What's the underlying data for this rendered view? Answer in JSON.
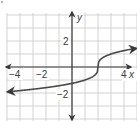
{
  "chart_data": {
    "type": "line",
    "title": "",
    "function": "y = cbrt(x - 2)",
    "xlabel": "x",
    "ylabel": "y",
    "xlim": [
      -5,
      5
    ],
    "ylim": [
      -4,
      4
    ],
    "grid": true,
    "grid_step": 1,
    "x_tick_labels": [
      {
        "value": -4,
        "label": "−4"
      },
      {
        "value": -2,
        "label": "−2"
      },
      {
        "value": 4,
        "label": "4"
      }
    ],
    "y_tick_labels": [
      {
        "value": 2,
        "label": "2"
      },
      {
        "value": -2,
        "label": "−2"
      }
    ],
    "series": [
      {
        "name": "curve",
        "arrows_both_ends": true,
        "x": [
          -5,
          -4,
          -3,
          -2,
          -1,
          0,
          1,
          1.5,
          1.9,
          2,
          2.1,
          2.5,
          3,
          4,
          5
        ],
        "y": [
          -1.91,
          -1.82,
          -1.71,
          -1.59,
          -1.44,
          -1.26,
          -1.0,
          -0.79,
          -0.46,
          0,
          0.46,
          0.79,
          1.0,
          1.26,
          1.44
        ]
      }
    ],
    "colors": {
      "grid": "#c8c8c8",
      "axes": "#3a3a3a",
      "curve": "#4a4a4a"
    }
  },
  "labels": {
    "x_axis": "x",
    "y_axis": "y",
    "x_neg4": "−4",
    "x_neg2": "−2",
    "x_4": "4",
    "y_2": "2",
    "y_neg2": "−2"
  }
}
